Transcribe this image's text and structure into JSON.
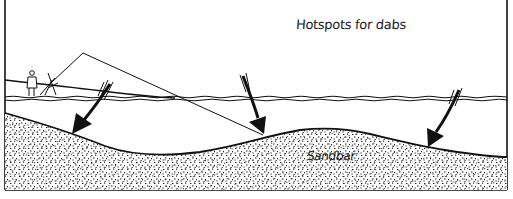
{
  "diagram": {
    "title": "Hotspots for dabs",
    "labels": {
      "sandbar": "Sandbar"
    },
    "elements": {
      "angler": "angler-figure",
      "rod": "fishing-rod",
      "line": "fishing-line",
      "water_surface": "water-surface",
      "shore": "shore-line",
      "sandbar": "sandbar-mound",
      "arrows": [
        {
          "name": "hotspot-arrow-near",
          "target": "inshore gully"
        },
        {
          "name": "hotspot-arrow-middle",
          "target": "front of sandbar"
        },
        {
          "name": "hotspot-arrow-far",
          "target": "back of sandbar"
        }
      ]
    },
    "colors": {
      "ink": "#111111",
      "background": "#ffffff",
      "sand_dots": "#222222"
    }
  }
}
